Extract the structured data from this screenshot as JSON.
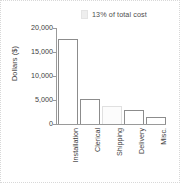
{
  "chart_data": {
    "type": "bar",
    "title": "",
    "xlabel": "",
    "ylabel": "Dollars ($)",
    "categories": [
      "Installation",
      "Clerical",
      "Shipping",
      "Delivery",
      "Misc."
    ],
    "values": [
      17800,
      5200,
      3800,
      2900,
      1500
    ],
    "ylim": [
      0,
      20000
    ],
    "ytick_labels": [
      "0",
      "5,000",
      "10,000",
      "15,000",
      "20,000"
    ],
    "ytick_values": [
      0,
      5000,
      10000,
      15000,
      20000
    ],
    "grid": false,
    "legend_position": "none",
    "annotations": [
      {
        "text": "13% of total cost",
        "swatch_color": "#eeeeee",
        "refers_to": "Shipping"
      }
    ],
    "bar_style": {
      "fill": "#ffffff",
      "stroke": "#8c8c8c",
      "faded_stroke": "#e0e0e0",
      "faded_index": 2
    }
  },
  "axis": {
    "label_y": "Dollars ($)"
  },
  "annotation": {
    "text": "13% of total cost"
  }
}
